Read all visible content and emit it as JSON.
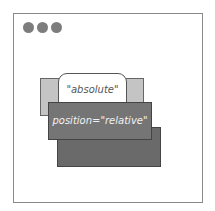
{
  "diagram": {
    "window_dots": 3,
    "absolute_label": "\"absolute\"",
    "relative_label": "position=\"relative\""
  }
}
